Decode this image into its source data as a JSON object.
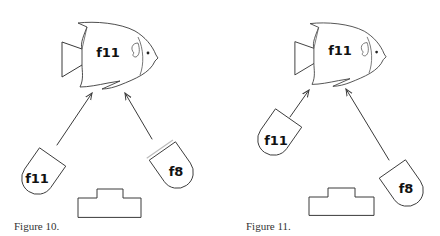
{
  "figures": [
    {
      "caption": "Figure 10.",
      "subject": {
        "type": "fish",
        "label": "f11"
      },
      "lenses": [
        {
          "position": "left",
          "label": "f11"
        },
        {
          "position": "right",
          "label": "f8"
        }
      ],
      "stage": {
        "type": "stepped-platform"
      }
    },
    {
      "caption": "Figure 11.",
      "subject": {
        "type": "fish",
        "label": "f11"
      },
      "lenses": [
        {
          "position": "left-raised",
          "label": "f11"
        },
        {
          "position": "right-lowered",
          "label": "f8"
        }
      ],
      "stage": {
        "type": "stepped-platform"
      }
    }
  ],
  "colors": {
    "line": "#3a3a3a",
    "text": "#111111",
    "background": "#ffffff"
  }
}
